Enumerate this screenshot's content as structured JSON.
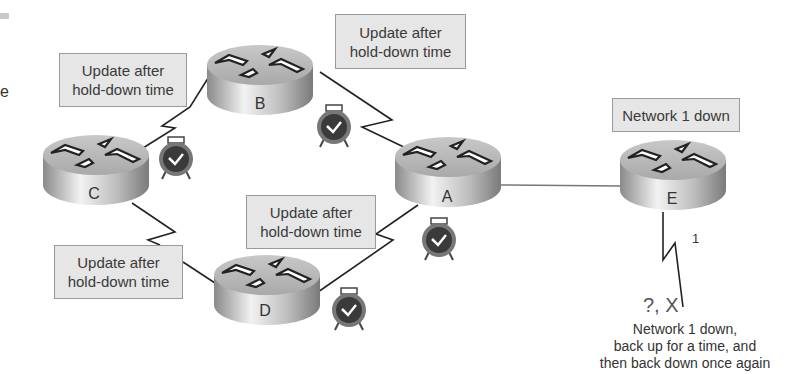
{
  "routers": [
    {
      "id": "A",
      "label": "A"
    },
    {
      "id": "B",
      "label": "B"
    },
    {
      "id": "C",
      "label": "C"
    },
    {
      "id": "D",
      "label": "D"
    },
    {
      "id": "E",
      "label": "E"
    }
  ],
  "callouts": {
    "c_box": [
      "Update after",
      "hold-down time"
    ],
    "b_box": [
      "Update after",
      "hold-down time"
    ],
    "a_box": [
      "Update after",
      "hold-down time"
    ],
    "d_box": [
      "Update after",
      "hold-down time"
    ],
    "e_box": "Network 1 down"
  },
  "link_label": "1",
  "status_marks": "?, X",
  "footnote": [
    "Network 1 down,",
    "back up for a time, and",
    "then back down once again"
  ],
  "edge_fragment": "e",
  "colors": {
    "box_fill": "#e6e6e6",
    "box_border": "#9a9a9a",
    "line": "#222222",
    "clock_face": "#3a3a3a"
  }
}
